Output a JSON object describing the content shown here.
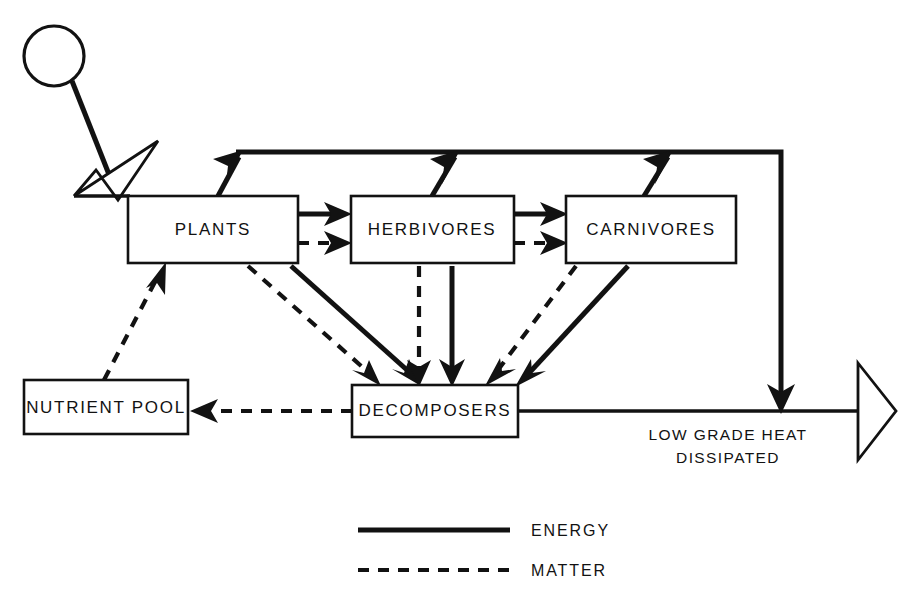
{
  "diagram": {
    "background_color": "#ffffff",
    "ink_color": "#121212",
    "nodes": [
      {
        "id": "plants",
        "label": "PLANTS",
        "x": 128,
        "y": 196,
        "w": 170,
        "h": 67
      },
      {
        "id": "herbivores",
        "label": "HERBIVORES",
        "x": 351,
        "y": 196,
        "w": 163,
        "h": 67
      },
      {
        "id": "carnivores",
        "label": "CARNIVORES",
        "x": 566,
        "y": 196,
        "w": 170,
        "h": 67
      },
      {
        "id": "nutrient",
        "label": "NUTRIENT POOL",
        "x": 24,
        "y": 380,
        "w": 164,
        "h": 54
      },
      {
        "id": "decomposers",
        "label": "DECOMPOSERS",
        "x": 352,
        "y": 385,
        "w": 166,
        "h": 52
      }
    ],
    "sun": {
      "name": "sun",
      "cx": 54,
      "cy": 56,
      "r": 30
    },
    "free_labels": [
      {
        "id": "heat",
        "line1": "LOW GRADE HEAT",
        "line2": "DISSIPATED",
        "x": 728,
        "y": 432
      }
    ],
    "legend": {
      "items": [
        {
          "id": "energy",
          "label": "ENERGY",
          "style": "solid"
        },
        {
          "id": "matter",
          "label": "MATTER",
          "style": "dashed"
        }
      ]
    },
    "flows": {
      "sunlight_to_plants": "solar energy input",
      "plants_to_herbivores_energy": "ENERGY",
      "plants_to_herbivores_matter": "MATTER",
      "herbivores_to_carnivores_energy": "ENERGY",
      "herbivores_to_carnivores_matter": "MATTER",
      "plants_to_decomposers_energy": "ENERGY",
      "plants_to_decomposers_matter": "MATTER",
      "herbivores_to_decomposers_energy": "ENERGY",
      "herbivores_to_decomposers_matter": "MATTER",
      "carnivores_to_decomposers_energy": "ENERGY",
      "carnivores_to_decomposers_matter": "MATTER",
      "decomposers_to_nutrient_matter": "MATTER",
      "nutrient_to_plants_matter": "MATTER",
      "respiration_heat_loss": "ENERGY"
    }
  }
}
